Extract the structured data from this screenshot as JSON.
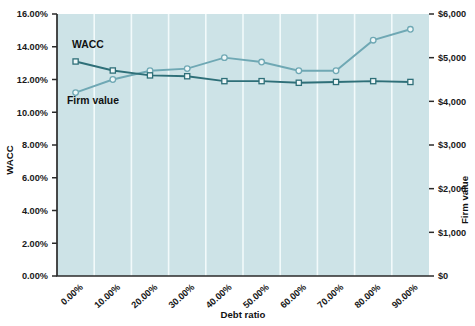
{
  "chart_data": {
    "type": "line",
    "title": "",
    "xlabel": "Debt ratio",
    "ylabel": "WACC",
    "y2label": "Firm value",
    "grid": true,
    "legend_position": "inline-annotation",
    "categories": [
      "0.00%",
      "10.00%",
      "20.00%",
      "30.00%",
      "40.00%",
      "50.00%",
      "60.00%",
      "70.00%",
      "80.00%",
      "90.00%"
    ],
    "x_tick_labels": [
      "0.00%",
      "10.00%",
      "20.00%",
      "30.00%",
      "40.00%",
      "50.00%",
      "60.00%",
      "70.00%",
      "80.00%",
      "90.00%"
    ],
    "y_tick_labels": [
      "16.00%",
      "14.00%",
      "12.00%",
      "10.00%",
      "8.00%",
      "6.00%",
      "4.00%",
      "2.00%",
      "0.00%"
    ],
    "y2_tick_labels": [
      "$6,000",
      "$5,000",
      "$4,000",
      "$3,000",
      "$2,000",
      "$1,000",
      "$0"
    ],
    "ylim": [
      0,
      16
    ],
    "y2lim": [
      0,
      6000
    ],
    "y_tick_step": 2,
    "y2_tick_step": 1000,
    "series": [
      {
        "name": "WACC",
        "axis": "left",
        "color": "#2e6f78",
        "marker": "square",
        "values": [
          13.1,
          12.55,
          12.25,
          12.2,
          11.9,
          11.9,
          11.8,
          11.85,
          11.9,
          11.85
        ]
      },
      {
        "name": "Firm value",
        "axis": "right",
        "color": "#6fa8b4",
        "marker": "circle",
        "values": [
          4200,
          4500,
          4700,
          4750,
          5000,
          4900,
          4700,
          4700,
          5400,
          5650
        ]
      }
    ],
    "annotations": [
      {
        "text": "WACC",
        "series": "WACC"
      },
      {
        "text": "Firm value",
        "series": "Firm value"
      }
    ],
    "colors": {
      "plot_background": "#cde3e7",
      "gridline": "#f2fafb",
      "axis": "#2b2b2b",
      "wacc": "#2e6f78",
      "firm_value": "#6fa8b4"
    }
  }
}
